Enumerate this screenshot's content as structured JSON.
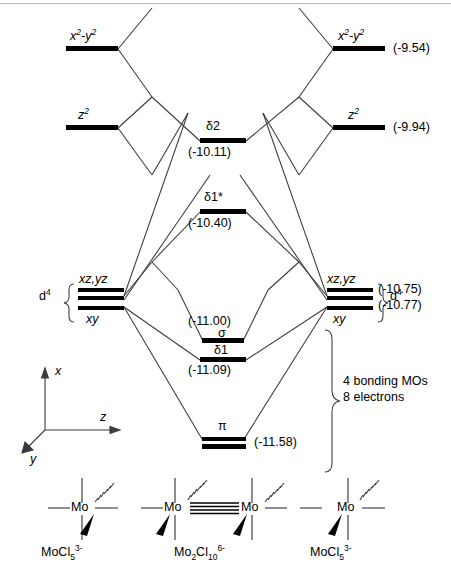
{
  "diagram": {
    "type": "mo-correlation-diagram"
  },
  "left_fragment": {
    "d_config_label": "d",
    "d_config_sup": "4",
    "levels": [
      {
        "name": "x2-y2",
        "label_html": "x<sup>2</sup>-y<sup>2</sup>",
        "y": 49
      },
      {
        "name": "z2",
        "label_html": "z<sup>2</sup>",
        "y": 128
      },
      {
        "name": "xz,yz",
        "label_html": "xz,yz",
        "y": 293
      },
      {
        "name": "xy",
        "label_html": "xy",
        "y": 311
      }
    ]
  },
  "right_fragment": {
    "d_config_label": "d",
    "d_config_sup": "4",
    "levels": [
      {
        "name": "x2-y2",
        "label_html": "x<sup>2</sup>-y<sup>2</sup>",
        "y": 49,
        "energy": "(-9.54)"
      },
      {
        "name": "z2",
        "label_html": "z<sup>2</sup>",
        "y": 128,
        "energy": "(-9.94)"
      },
      {
        "name": "xz,yz",
        "label_html": "xz,yz",
        "y": 293,
        "energy": "(-10.75)"
      },
      {
        "name": "xy",
        "label_html": "xy",
        "y": 311,
        "energy": "(-10.77)"
      }
    ]
  },
  "molecular_orbitals": [
    {
      "name": "delta2",
      "label": "δ2",
      "energy": "(-10.11)",
      "y": 141
    },
    {
      "name": "delta1-star",
      "label": "δ1*",
      "energy": "(-10.40)",
      "y": 212
    },
    {
      "name": "sigma",
      "label": "σ",
      "energy": "(-11.00)",
      "y": 341
    },
    {
      "name": "delta1",
      "label": "δ1",
      "energy": "(-11.09)",
      "y": 360
    },
    {
      "name": "pi",
      "label": "π",
      "energy": "(-11.58)",
      "y": 441
    }
  ],
  "annotations": {
    "bonding_line1": "4 bonding MOs",
    "bonding_line2": "8 electrons"
  },
  "axes": {
    "x_label": "x",
    "y_label": "y",
    "z_label": "z"
  },
  "structures": [
    {
      "name": "left-complex",
      "center": "Mo",
      "formula_base": "MoCl",
      "formula_sub": "5",
      "formula_sup": "3-"
    },
    {
      "name": "center-dimer",
      "center_left": "Mo",
      "center_right": "Mo",
      "formula_base": "Mo",
      "formula_sub1": "2",
      "formula_cl": "Cl",
      "formula_sub2": "10",
      "formula_sup": "6-"
    },
    {
      "name": "right-complex",
      "center": "Mo",
      "formula_base": "MoCl",
      "formula_sub": "5",
      "formula_sup": "3-"
    }
  ],
  "colors": {
    "ink": "#000000",
    "line": "#3a3a3a",
    "rule": "#b9b9b9",
    "background": "#ffffff"
  }
}
